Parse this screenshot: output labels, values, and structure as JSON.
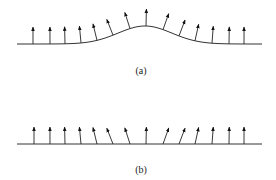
{
  "figure": {
    "panels": [
      {
        "id": "a",
        "label": "(a)",
        "description": "Normal vectors on a surface with a Gaussian bump",
        "baseline_y": 44,
        "x_start": 17,
        "x_end": 262,
        "bump": {
          "center_x": 145,
          "height": 18,
          "width": 38
        },
        "arrow_x": [
          33,
          50,
          65,
          81,
          97,
          113,
          130,
          146,
          163,
          179,
          195,
          212,
          229,
          244
        ],
        "arrow_length": 17
      },
      {
        "id": "b",
        "label": "(b)",
        "description": "Same normal vectors placed on a flat surface",
        "baseline_y": 144,
        "x_start": 17,
        "x_end": 262,
        "arrow_x": [
          34,
          50,
          65,
          81,
          97,
          113,
          130,
          146,
          163,
          179,
          195,
          212,
          229,
          244
        ],
        "arrow_length": 17
      }
    ],
    "colors": {
      "line": "#333333",
      "arrow": "#111111"
    }
  }
}
